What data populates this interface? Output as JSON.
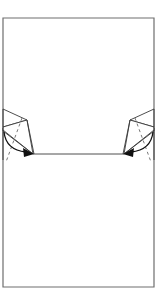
{
  "diagram": {
    "type": "origami-fold-step",
    "colors": {
      "paper_edge": "#6e6e6e",
      "fold_lines": "#3a3a3a",
      "arrow": "#111111",
      "background": "#ffffff"
    },
    "elements": {
      "paper": {
        "label": "paper-rectangle"
      },
      "fold_line": {
        "label": "horizontal-fold-line"
      },
      "left_flap": {
        "label": "left-flap",
        "arrow_direction": "clockwise-down-right"
      },
      "right_flap": {
        "label": "right-flap",
        "arrow_direction": "counterclockwise-down-left"
      }
    }
  }
}
